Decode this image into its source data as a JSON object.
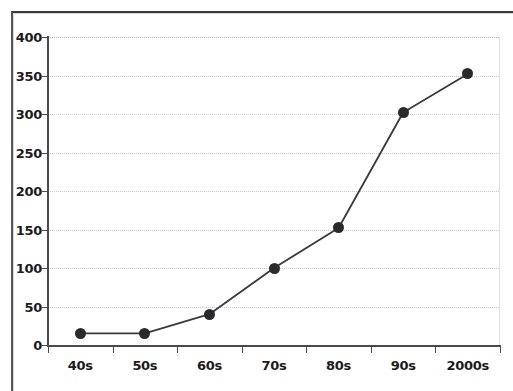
{
  "chart_data": {
    "type": "line",
    "title": "",
    "subtitle": "",
    "xlabel": "",
    "ylabel": "",
    "categories": [
      "40s",
      "50s",
      "60s",
      "70s",
      "80s",
      "90s",
      "2000s"
    ],
    "values": [
      15,
      15,
      40,
      100,
      152,
      302,
      352
    ],
    "series": [
      {
        "name": "",
        "values": [
          15,
          15,
          40,
          100,
          152,
          302,
          352
        ]
      }
    ],
    "ylim": [
      0,
      400
    ],
    "y_ticks": [
      0,
      50,
      100,
      150,
      200,
      250,
      300,
      350,
      400
    ],
    "y_tick_labels": [
      "0",
      "50",
      "100",
      "150",
      "200",
      "250",
      "300",
      "350",
      "400"
    ],
    "x_tick_labels": [
      "40s",
      "50s",
      "60s",
      "70s",
      "80s",
      "90s",
      "2000s"
    ],
    "grid": true,
    "grid_axis": "y",
    "grid_style": "dotted",
    "legend": false,
    "legend_position": "none",
    "marker": "filled-circle",
    "colors": {
      "line": "#3a3a3d",
      "marker": "#2a2a2c",
      "axis": "#4a4a4e",
      "gridline": "#c9c9cc",
      "plot_background": "#ffffff",
      "frame_border": "#56565a",
      "tick_label": "#1b1b1b"
    }
  }
}
